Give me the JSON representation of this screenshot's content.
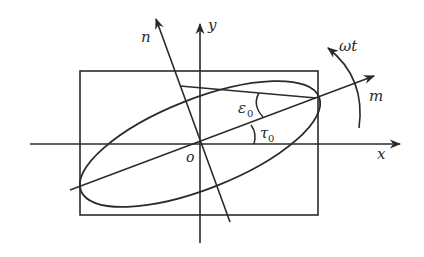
{
  "diagram": {
    "type": "polarization-ellipse",
    "labels": {
      "x_axis": "x",
      "y_axis": "y",
      "m_axis": "m",
      "n_axis": "n",
      "origin": "o",
      "ellipticity_symbol": "ε",
      "ellipticity_sub": "0",
      "azimuth_symbol": "τ",
      "azimuth_sub": "0",
      "rotation": "ωt"
    },
    "colors": {
      "stroke": "#2a2a2a",
      "background": "#ffffff"
    },
    "geometry": {
      "origin": [
        200,
        144
      ],
      "rectangle": {
        "x": 80,
        "y": 71,
        "width": 238,
        "height": 144
      },
      "ellipse": {
        "rx": 128,
        "ry": 45,
        "rotation_deg": -21.5
      },
      "azimuth_angle_deg": 21.5
    }
  }
}
